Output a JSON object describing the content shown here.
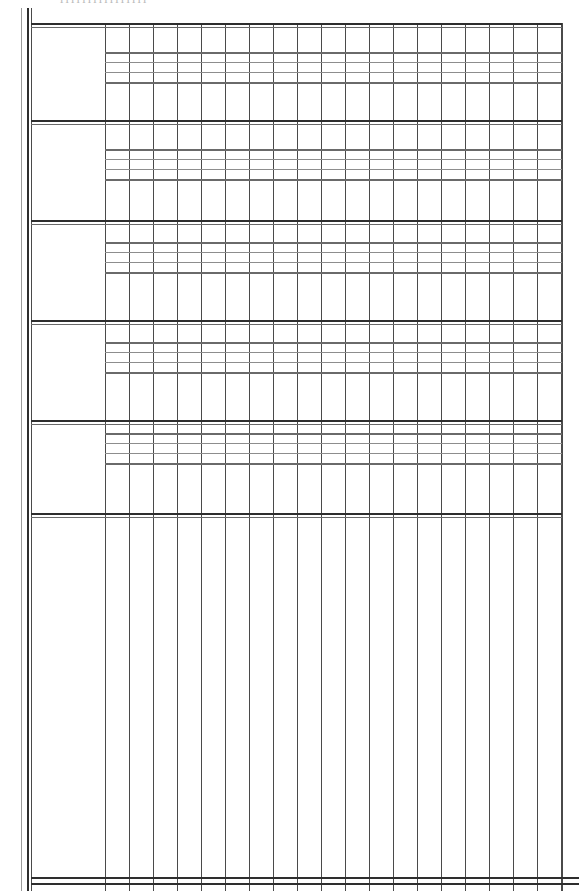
{
  "document": {
    "kind": "scanned-ruled-table",
    "title_fragment": "llllllllllllllll",
    "background_color": "#ffffff",
    "ink_color": "#2e2e2e",
    "width_px": 579,
    "height_px": 891
  },
  "frame": {
    "left_margin_rules": [
      {
        "name": "outer-margin-rule",
        "x": 21,
        "width": 1,
        "top": 8,
        "bottom": 891,
        "weight": "light",
        "color": "#9a9a9a"
      },
      {
        "name": "inner-margin-rule-a",
        "x": 27,
        "width": 2,
        "top": 8,
        "bottom": 891,
        "weight": "heavy",
        "color": "#2e2e2e"
      },
      {
        "name": "inner-margin-rule-b",
        "x": 31,
        "width": 1,
        "top": 8,
        "bottom": 891,
        "weight": "normal",
        "color": "#4a4a4a"
      }
    ],
    "label_column": {
      "name": "row-label-column",
      "left": 31,
      "right": 105,
      "content": ""
    },
    "grid_left": 105,
    "grid_right": 562,
    "top_rule_y": 23,
    "bottom_rule_y": 877
  },
  "columns": {
    "count": 20,
    "spacing_px": 24,
    "start_x": 105,
    "labels": [
      "",
      "",
      "",
      "",
      "",
      "",
      "",
      "",
      "",
      "",
      "",
      "",
      "",
      "",
      "",
      "",
      "",
      "",
      "",
      ""
    ]
  },
  "bands": [
    {
      "name": "band-1",
      "index": 1,
      "top_rule_y": 23,
      "header_label": "",
      "inner_rules_y": [
        52,
        62,
        72,
        82
      ],
      "inner_rule_weights": [
        "medium",
        "thin",
        "thin",
        "medium"
      ],
      "body_bottom_y": 120,
      "rows": [
        "",
        "",
        "",
        ""
      ]
    },
    {
      "name": "band-2",
      "index": 2,
      "top_rule_y": 120,
      "header_label": "",
      "inner_rules_y": [
        149,
        159,
        169,
        179
      ],
      "inner_rule_weights": [
        "medium",
        "thin",
        "thin",
        "medium"
      ],
      "body_bottom_y": 220,
      "rows": [
        "",
        "",
        "",
        ""
      ]
    },
    {
      "name": "band-3",
      "index": 3,
      "top_rule_y": 220,
      "header_label": "",
      "inner_rules_y": [
        242,
        252,
        262,
        272
      ],
      "inner_rule_weights": [
        "medium",
        "thin",
        "thin",
        "medium"
      ],
      "body_bottom_y": 320,
      "rows": [
        "",
        "",
        "",
        ""
      ]
    },
    {
      "name": "band-4",
      "index": 4,
      "top_rule_y": 320,
      "header_label": "",
      "inner_rules_y": [
        342,
        352,
        362,
        372
      ],
      "inner_rule_weights": [
        "medium",
        "thin",
        "thin",
        "medium"
      ],
      "body_bottom_y": 420,
      "rows": [
        "",
        "",
        "",
        ""
      ]
    },
    {
      "name": "band-5",
      "index": 5,
      "top_rule_y": 420,
      "header_label": "",
      "inner_rules_y": [
        433,
        443,
        453,
        463
      ],
      "inner_rule_weights": [
        "medium",
        "thin",
        "thin",
        "medium"
      ],
      "body_bottom_y": 513,
      "rows": [
        "",
        "",
        "",
        ""
      ]
    }
  ],
  "totals_rule": {
    "name": "section-closing-rule",
    "y": 513,
    "style": "double",
    "label": ""
  },
  "blank_section": {
    "name": "blank-entry-area",
    "top": 518,
    "bottom": 877,
    "label": "",
    "note": ""
  },
  "footer_rule": {
    "name": "footer-double-rule",
    "y": 877,
    "style": "double",
    "label": ""
  }
}
